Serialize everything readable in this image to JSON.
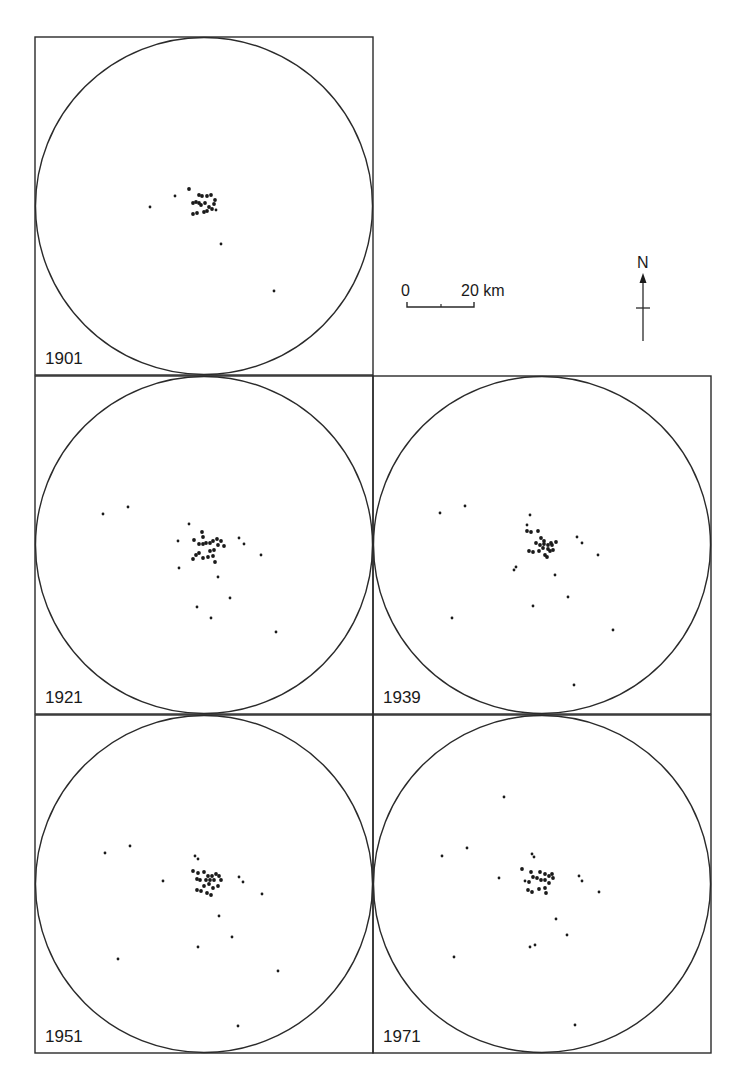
{
  "figure": {
    "line_color": "#2a2a2a",
    "dot_color": "#1a1a1a",
    "background": "#ffffff"
  },
  "scale_bar": {
    "start_label": "0",
    "end_label": "20 km"
  },
  "north_arrow": {
    "label": "N"
  },
  "panels": [
    {
      "year": "1901",
      "frame": {
        "x": 35,
        "y": 37,
        "size": 338
      },
      "outliers": [
        [
          175,
          196
        ],
        [
          150,
          207
        ],
        [
          216,
          210
        ],
        [
          221,
          244
        ],
        [
          274,
          291
        ]
      ],
      "cluster": [
        [
          189,
          189
        ],
        [
          199,
          195
        ],
        [
          202,
          196
        ],
        [
          207,
          196
        ],
        [
          211,
          195
        ],
        [
          215,
          200
        ],
        [
          214,
          204
        ],
        [
          209,
          207
        ],
        [
          201,
          205
        ],
        [
          199,
          203
        ],
        [
          196,
          202
        ],
        [
          193,
          203
        ],
        [
          205,
          203
        ],
        [
          212,
          209
        ],
        [
          207,
          211
        ],
        [
          193,
          214
        ],
        [
          197,
          213
        ],
        [
          204,
          212
        ]
      ]
    },
    {
      "year": "1921",
      "frame": {
        "x": 35,
        "y": 376,
        "size": 338
      },
      "outliers": [
        [
          103,
          514
        ],
        [
          128,
          507
        ],
        [
          189,
          524
        ],
        [
          178,
          541
        ],
        [
          179,
          568
        ],
        [
          218,
          577
        ],
        [
          239,
          538
        ],
        [
          244,
          544
        ],
        [
          261,
          555
        ],
        [
          230,
          598
        ],
        [
          197,
          607
        ],
        [
          211,
          618
        ],
        [
          276,
          632
        ]
      ],
      "cluster": [
        [
          202,
          532
        ],
        [
          203,
          537
        ],
        [
          194,
          540
        ],
        [
          199,
          544
        ],
        [
          203,
          544
        ],
        [
          206,
          543
        ],
        [
          210,
          543
        ],
        [
          213,
          541
        ],
        [
          217,
          539
        ],
        [
          218,
          545
        ],
        [
          221,
          541
        ],
        [
          224,
          546
        ],
        [
          214,
          550
        ],
        [
          210,
          551
        ],
        [
          196,
          555
        ],
        [
          199,
          553
        ],
        [
          193,
          559
        ],
        [
          203,
          558
        ],
        [
          208,
          557
        ],
        [
          213,
          556
        ],
        [
          215,
          562
        ]
      ]
    },
    {
      "year": "1939",
      "frame": {
        "x": 373,
        "y": 376,
        "size": 338
      },
      "outliers": [
        [
          440,
          513
        ],
        [
          465,
          506
        ],
        [
          530,
          515
        ],
        [
          527,
          525
        ],
        [
          516,
          567
        ],
        [
          514,
          570
        ],
        [
          555,
          575
        ],
        [
          577,
          537
        ],
        [
          582,
          543
        ],
        [
          598,
          555
        ],
        [
          568,
          597
        ],
        [
          533,
          606
        ],
        [
          452,
          618
        ],
        [
          613,
          630
        ],
        [
          574,
          685
        ]
      ],
      "cluster": [
        [
          527,
          531
        ],
        [
          538,
          531
        ],
        [
          531,
          532
        ],
        [
          541,
          538
        ],
        [
          536,
          543
        ],
        [
          540,
          545
        ],
        [
          544,
          544
        ],
        [
          548,
          545
        ],
        [
          552,
          545
        ],
        [
          544,
          541
        ],
        [
          551,
          543
        ],
        [
          556,
          542
        ],
        [
          548,
          549
        ],
        [
          529,
          551
        ],
        [
          533,
          552
        ],
        [
          539,
          551
        ],
        [
          543,
          548
        ],
        [
          550,
          551
        ],
        [
          553,
          550
        ],
        [
          545,
          555
        ],
        [
          547,
          557
        ]
      ]
    },
    {
      "year": "1951",
      "frame": {
        "x": 35,
        "y": 715,
        "size": 338
      },
      "outliers": [
        [
          105,
          853
        ],
        [
          130,
          846
        ],
        [
          163,
          881
        ],
        [
          195,
          856
        ],
        [
          198,
          859
        ],
        [
          239,
          877
        ],
        [
          243,
          882
        ],
        [
          262,
          894
        ],
        [
          219,
          916
        ],
        [
          232,
          937
        ],
        [
          198,
          947
        ],
        [
          118,
          959
        ],
        [
          278,
          971
        ],
        [
          238,
          1026
        ]
      ],
      "cluster": [
        [
          193,
          871
        ],
        [
          198,
          873
        ],
        [
          204,
          872
        ],
        [
          208,
          876
        ],
        [
          212,
          876
        ],
        [
          216,
          874
        ],
        [
          219,
          876
        ],
        [
          221,
          880
        ],
        [
          214,
          880
        ],
        [
          210,
          880
        ],
        [
          206,
          880
        ],
        [
          200,
          880
        ],
        [
          197,
          879
        ],
        [
          204,
          886
        ],
        [
          209,
          884
        ],
        [
          218,
          886
        ],
        [
          213,
          888
        ],
        [
          197,
          890
        ],
        [
          201,
          891
        ],
        [
          207,
          893
        ],
        [
          211,
          895
        ]
      ]
    },
    {
      "year": "1971",
      "frame": {
        "x": 373,
        "y": 715,
        "size": 338
      },
      "outliers": [
        [
          504,
          797
        ],
        [
          442,
          856
        ],
        [
          467,
          848
        ],
        [
          532,
          854
        ],
        [
          534,
          857
        ],
        [
          499,
          878
        ],
        [
          525,
          881
        ],
        [
          579,
          876
        ],
        [
          582,
          881
        ],
        [
          599,
          892
        ],
        [
          556,
          919
        ],
        [
          567,
          935
        ],
        [
          530,
          947
        ],
        [
          535,
          945
        ],
        [
          454,
          957
        ],
        [
          575,
          1025
        ]
      ],
      "cluster": [
        [
          522,
          869
        ],
        [
          531,
          872
        ],
        [
          540,
          872
        ],
        [
          545,
          874
        ],
        [
          549,
          876
        ],
        [
          552,
          874
        ],
        [
          553,
          878
        ],
        [
          545,
          880
        ],
        [
          541,
          880
        ],
        [
          537,
          878
        ],
        [
          533,
          877
        ],
        [
          529,
          882
        ],
        [
          549,
          883
        ],
        [
          528,
          890
        ],
        [
          532,
          892
        ],
        [
          539,
          889
        ],
        [
          545,
          888
        ],
        [
          546,
          893
        ]
      ]
    }
  ]
}
